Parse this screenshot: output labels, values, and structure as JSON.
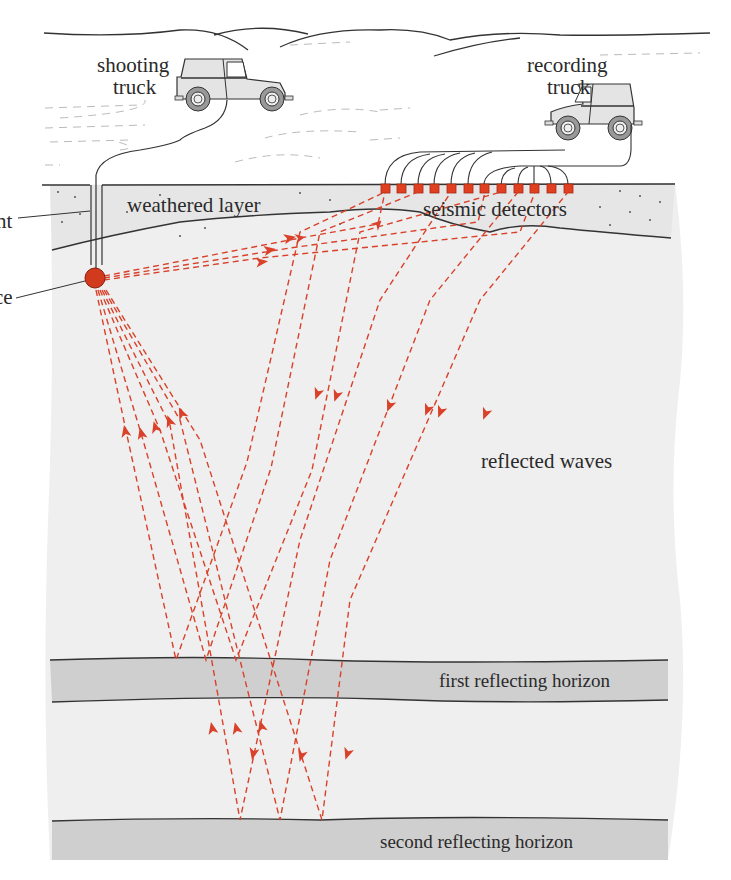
{
  "labels": {
    "shooting_truck_1": "shooting",
    "shooting_truck_2": "truck",
    "recording_truck_1": "recording",
    "recording_truck_2": "truck",
    "weathered_layer": "weathered layer",
    "seismic_detectors": "seismic detectors",
    "cement_partial": "nt",
    "source_partial": "ce",
    "reflected_waves": "reflected waves",
    "first_horizon": "first reflecting horizon",
    "second_horizon": "second reflecting horizon"
  },
  "colors": {
    "ray": "#d9412a",
    "source": "#d23a1e",
    "detector": "#e0401f",
    "subsurface": "#efefef",
    "horizon_band": "#cfcfcf",
    "outline": "#333333"
  },
  "detectors": {
    "count": 12
  }
}
